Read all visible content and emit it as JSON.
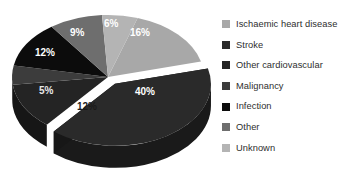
{
  "chart_data": {
    "type": "pie",
    "title": "",
    "exploded_index": 1,
    "legend_position": "right",
    "grid": false,
    "categories": [
      "Ischaemic heart disease",
      "Stroke",
      "Other cardiovascular",
      "Malignancy",
      "Infection",
      "Other",
      "Unknown"
    ],
    "values": [
      16,
      40,
      12,
      5,
      12,
      9,
      6
    ],
    "value_labels": [
      "16%",
      "40%",
      "12%",
      "5%",
      "12%",
      "9%",
      "6%"
    ],
    "colors": [
      "#a8a8a8",
      "#2a2a2a",
      "#242424",
      "#3c3c3c",
      "#0c0c0c",
      "#6e6e6e",
      "#b4b4b4"
    ],
    "label_text_colors": [
      "#ffffff",
      "#ffffff",
      "#f2f2f2",
      "#ffffff",
      "#1c1c1c",
      "#ffffff",
      "#ffffff"
    ]
  },
  "legend": {
    "items": [
      {
        "label": "Ischaemic heart disease",
        "color": "#a8a8a8"
      },
      {
        "label": "Stroke",
        "color": "#2a2a2a"
      },
      {
        "label": "Other cardiovascular",
        "color": "#242424"
      },
      {
        "label": "Malignancy",
        "color": "#3c3c3c"
      },
      {
        "label": "Infection",
        "color": "#0c0c0c"
      },
      {
        "label": "Other",
        "color": "#6e6e6e"
      },
      {
        "label": "Unknown",
        "color": "#b4b4b4"
      }
    ]
  },
  "slice_labels": [
    {
      "text": "16%",
      "x": 130,
      "y": 27,
      "color": "#ffffff"
    },
    {
      "text": "40%",
      "x": 135,
      "y": 86,
      "color": "#ffffff"
    },
    {
      "text": "12%",
      "x": 77,
      "y": 101,
      "color": "#1a1a1a"
    },
    {
      "text": "5%",
      "x": 39,
      "y": 85,
      "color": "#e8e8e8"
    },
    {
      "text": "12%",
      "x": 35,
      "y": 47,
      "color": "#ffffff"
    },
    {
      "text": "9%",
      "x": 70,
      "y": 27,
      "color": "#ffffff"
    },
    {
      "text": "6%",
      "x": 104,
      "y": 18,
      "color": "#ffffff"
    }
  ]
}
